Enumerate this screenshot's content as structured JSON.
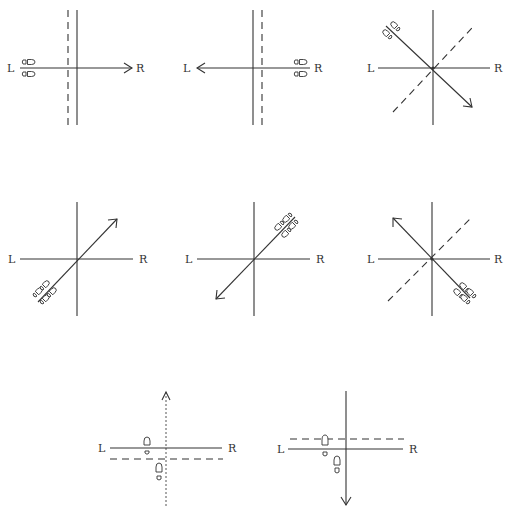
{
  "figure": {
    "labels": {
      "left": "L",
      "right": "R"
    },
    "line_color": "#333333",
    "background": "#ffffff"
  },
  "diagrams": [
    {
      "id": 1,
      "row": 1,
      "col": 1,
      "movement": "right",
      "feet_position": "left end",
      "dashed_line": "vertical, left of center",
      "left_label": "L",
      "right_label": "R"
    },
    {
      "id": 2,
      "row": 1,
      "col": 2,
      "movement": "left",
      "feet_position": "right end",
      "dashed_line": "vertical, right of center",
      "left_label": "L",
      "right_label": "R"
    },
    {
      "id": 3,
      "row": 1,
      "col": 3,
      "movement": "diagonal down-right",
      "feet_position": "upper-left",
      "dashed_line": "diagonal lower-left to upper-right",
      "left_label": "L",
      "right_label": "R"
    },
    {
      "id": 4,
      "row": 2,
      "col": 1,
      "movement": "diagonal up-right",
      "feet_position": "lower-left",
      "dashed_line": "none",
      "left_label": "L",
      "right_label": "R"
    },
    {
      "id": 5,
      "row": 2,
      "col": 2,
      "movement": "diagonal down-left",
      "feet_position": "upper-right",
      "dashed_line": "none",
      "left_label": "L",
      "right_label": "R"
    },
    {
      "id": 6,
      "row": 2,
      "col": 3,
      "movement": "diagonal up-left",
      "feet_position": "lower-right",
      "dashed_line": "diagonal lower-left to upper-right",
      "left_label": "L",
      "right_label": "R"
    },
    {
      "id": 7,
      "row": 3,
      "col": 1,
      "movement": "forward (up)",
      "feet_position": "staggered around center",
      "dashed_line": "horizontal, below center",
      "vertical_line": "dotted",
      "left_label": "L",
      "right_label": "R"
    },
    {
      "id": 8,
      "row": 3,
      "col": 2,
      "movement": "backward (down)",
      "feet_position": "staggered around center",
      "dashed_line": "horizontal, above center",
      "vertical_line": "solid",
      "left_label": "L",
      "right_label": "R"
    }
  ]
}
